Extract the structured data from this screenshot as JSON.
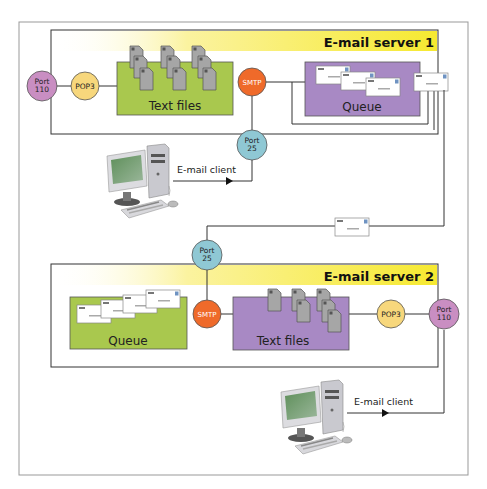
{
  "server1": {
    "title": "E-mail server 1",
    "port110": {
      "line1": "Port",
      "line2": "110"
    },
    "pop3": "POP3",
    "textfiles": "Text files",
    "smtp": "SMTP",
    "queue": "Queue",
    "port25": {
      "line1": "Port",
      "line2": "25"
    }
  },
  "client1": {
    "label": "E-mail client"
  },
  "server2": {
    "title": "E-mail server 2",
    "port25": {
      "line1": "Port",
      "line2": "25"
    },
    "queue": "Queue",
    "smtp": "SMTP",
    "textfiles": "Text files",
    "pop3": "POP3",
    "port110": {
      "line1": "Port",
      "line2": "110"
    }
  },
  "client2": {
    "label": "E-mail client"
  },
  "colors": {
    "port110": "#c98ec2",
    "pop3": "#f7d77c",
    "smtp": "#ef6a2a",
    "port25": "#8fc8d4",
    "green_box": "#a9c84e",
    "purple_box": "#a889c4",
    "title_band": "#f7ea3a"
  }
}
